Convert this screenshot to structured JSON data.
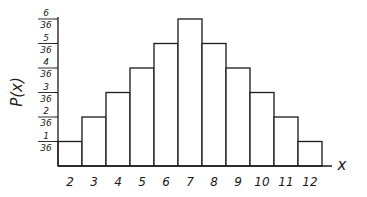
{
  "chart_data": {
    "type": "bar",
    "title": "",
    "xlabel": "x",
    "ylabel": "P(x)",
    "categories": [
      "2",
      "3",
      "4",
      "5",
      "6",
      "7",
      "8",
      "9",
      "10",
      "11",
      "12"
    ],
    "values": [
      1,
      2,
      3,
      4,
      5,
      6,
      5,
      4,
      3,
      2,
      1
    ],
    "value_denominator": 36,
    "probabilities": [
      0.0278,
      0.0556,
      0.0833,
      0.1111,
      0.1389,
      0.1667,
      0.1389,
      0.1111,
      0.0833,
      0.0556,
      0.0278
    ],
    "y_ticks": [
      {
        "num": "1",
        "den": "36"
      },
      {
        "num": "2",
        "den": "36"
      },
      {
        "num": "3",
        "den": "36"
      },
      {
        "num": "4",
        "den": "36"
      },
      {
        "num": "5",
        "den": "36"
      },
      {
        "num": "6",
        "den": "36"
      }
    ],
    "ylim": [
      0,
      0.1667
    ],
    "grid": false,
    "legend": null,
    "style": "hand-drawn histogram, black outlines, white fill"
  },
  "colors": {
    "stroke": "#1a1a1a",
    "fill": "#ffffff",
    "background": "#ffffff"
  }
}
